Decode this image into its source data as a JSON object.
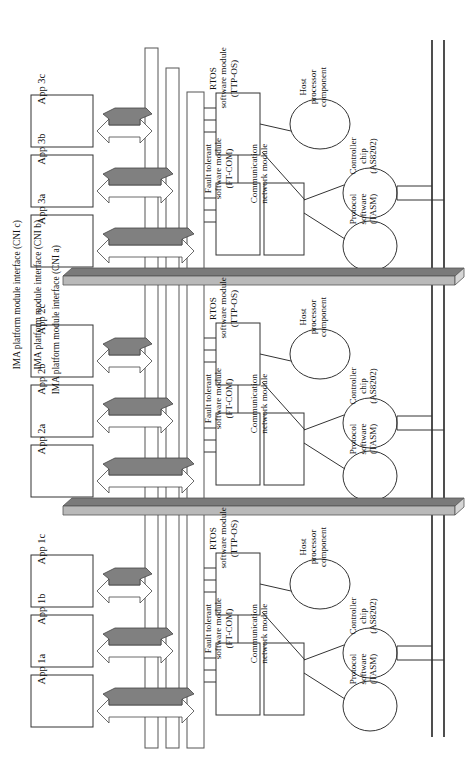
{
  "diagram": {
    "orientation": "rotated-90",
    "colors": {
      "stroke": "#222222",
      "fill_white": "#ffffff",
      "arrow_top_gray": "#808080",
      "slab_gray": "#7a7a7a",
      "slab_edge_gray": "#c8c8c8",
      "bus_line": "#222222"
    }
  },
  "groups": [
    {
      "id": "group-3",
      "apps": [
        {
          "label": "App 3c"
        },
        {
          "label": "App 3b"
        },
        {
          "label": "App 3a"
        }
      ],
      "modules": [
        {
          "label": "RTOS\nsoftware module\n(TTP-OS)"
        },
        {
          "label": "Fault tolerant\nsoftware module\n(FT-COM)"
        },
        {
          "label": "Communication\nnetwork module"
        }
      ],
      "ellipses": [
        {
          "label": "Host\nprocessor\ncomponent"
        },
        {
          "label": "Controller\nchip\n(AS8202)"
        },
        {
          "label": "Protocol\nsoftware\n(TASM)"
        }
      ]
    },
    {
      "id": "group-2",
      "apps": [
        {
          "label": "App 2c"
        },
        {
          "label": "App 2b"
        },
        {
          "label": "App 2a"
        }
      ],
      "modules": [
        {
          "label": "RTOS\nsoftware module\n(TTP-OS)"
        },
        {
          "label": "Fault tolerant\nsoftware module\n(FT-COM)"
        },
        {
          "label": "Communication\nnetwork module"
        }
      ],
      "ellipses": [
        {
          "label": "Host\nprocessor\ncomponent"
        },
        {
          "label": "Controller\nchip\n(AS8202)"
        },
        {
          "label": "Protocol\nsoftware\n(TASM)"
        }
      ]
    },
    {
      "id": "group-1",
      "apps": [
        {
          "label": "App 1c"
        },
        {
          "label": "App 1b"
        },
        {
          "label": "App 1a"
        }
      ],
      "modules": [
        {
          "label": "RTOS\nsoftware module\n(TTP-OS)"
        },
        {
          "label": "Fault tolerant\nsoftware module\n(FT-COM)"
        },
        {
          "label": "Communication\nnetwork module"
        }
      ],
      "ellipses": [
        {
          "label": "Host\nprocessor\ncomponent"
        },
        {
          "label": "Controller\nchip\n(AS8202)"
        },
        {
          "label": "Protocol\nsoftware\n(TASM)"
        }
      ]
    }
  ],
  "cni_bars": [
    {
      "id": "cni-c",
      "label": "IMA platform module interface (CNI c)"
    },
    {
      "id": "cni-b",
      "label": "IMA platform module interface (CNI b)"
    },
    {
      "id": "cni-a",
      "label": "IMA platform module interface (CNI a)"
    }
  ],
  "buses": [
    {
      "id": "bus-line-1"
    },
    {
      "id": "bus-line-2"
    }
  ],
  "slabs": [
    {
      "id": "slab-top"
    },
    {
      "id": "slab-bottom"
    }
  ]
}
